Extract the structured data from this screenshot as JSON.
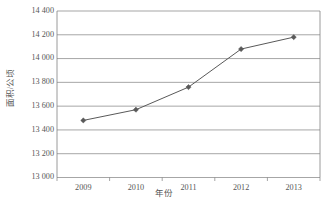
{
  "chart_data": {
    "type": "line",
    "title": "",
    "subtitle": "",
    "xlabel": "年份",
    "ylabel": "面积/公顷",
    "categories": [
      "2009",
      "2010",
      "2011",
      "2012",
      "2013"
    ],
    "x": [
      2009,
      2010,
      2011,
      2012,
      2013
    ],
    "values": [
      13480,
      13570,
      13760,
      14080,
      14180
    ],
    "series": [
      {
        "name": "面积/公顷",
        "values": [
          13480,
          13570,
          13760,
          14080,
          14180
        ],
        "color": "#595959",
        "marker": "diamond",
        "line_width": 1
      }
    ],
    "ylim": [
      13000,
      14400
    ],
    "ytick_step": 200,
    "ytick_labels": [
      "14 400",
      "14 200",
      "14 000",
      "13 800",
      "13 600",
      "13 400",
      "13 200",
      "13 000"
    ],
    "ytick_values": [
      14400,
      14200,
      14000,
      13800,
      13600,
      13400,
      13200,
      13000
    ],
    "xtick_labels": [
      "2009",
      "2010",
      "2011",
      "2012",
      "2013"
    ],
    "grid": {
      "horizontal": true,
      "vertical": false,
      "color": "#808080"
    },
    "legend": {
      "visible": false,
      "position": "none"
    },
    "axis_color": "#808080",
    "plot_background": "#ffffff",
    "annotations": []
  }
}
